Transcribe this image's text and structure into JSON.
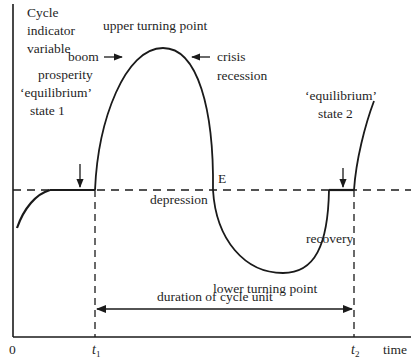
{
  "diagram": {
    "y_axis_label": [
      "Cycle",
      "indicator",
      "variable"
    ],
    "x_axis_label": "time",
    "origin_label": "0",
    "t1_label": "t",
    "t1_sub": "1",
    "t2_label": "t",
    "t2_sub": "2",
    "upper_turning_point": "upper turning point",
    "lower_turning_point": "lower turning point",
    "boom": "boom",
    "prosperity": "prosperity",
    "equilibrium_1": "‘equilibrium’",
    "state_1": "state 1",
    "crisis": "crisis",
    "recession": "recession",
    "equilibrium_2": "‘equilibrium’",
    "state_2": "state 2",
    "e_point": "E",
    "depression": "depression",
    "recovery": "recovery",
    "duration": "duration of cycle unit"
  }
}
